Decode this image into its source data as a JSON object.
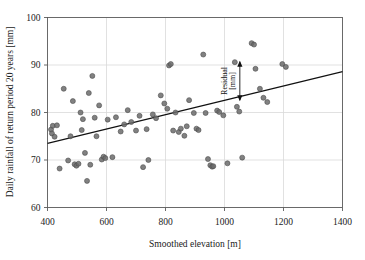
{
  "chart_data": {
    "type": "scatter",
    "title": "",
    "xlabel": "Smoothed elevation [m]",
    "ylabel": "Daily rainfall of return period 20 years [mm]",
    "xlim": [
      400,
      1400
    ],
    "ylim": [
      60,
      100
    ],
    "xticks": [
      400,
      600,
      800,
      1000,
      1200,
      1400
    ],
    "yticks": [
      60,
      70,
      80,
      90,
      100
    ],
    "xtick_labels": [
      "400",
      "600",
      "800",
      "1000",
      "1200",
      "1400"
    ],
    "ytick_labels": [
      "60",
      "70",
      "80",
      "90",
      "100"
    ],
    "grid": true,
    "legend": "none",
    "marker": {
      "shape": "circle",
      "color": "#6b6b6b",
      "edge_color": "#4d4d4d",
      "size_px": 5,
      "opacity": 0.85
    },
    "points": [
      [
        412,
        76.4
      ],
      [
        415,
        75.6
      ],
      [
        418,
        77.2
      ],
      [
        424,
        74.9
      ],
      [
        432,
        77.3
      ],
      [
        441,
        68.2
      ],
      [
        455,
        85.0
      ],
      [
        470,
        69.9
      ],
      [
        478,
        75.0
      ],
      [
        486,
        82.4
      ],
      [
        492,
        69.1
      ],
      [
        498,
        68.8
      ],
      [
        505,
        69.2
      ],
      [
        512,
        80.0
      ],
      [
        516,
        76.3
      ],
      [
        520,
        78.6
      ],
      [
        527,
        71.5
      ],
      [
        534,
        65.6
      ],
      [
        540,
        84.1
      ],
      [
        545,
        69.0
      ],
      [
        552,
        87.7
      ],
      [
        560,
        78.9
      ],
      [
        566,
        75.0
      ],
      [
        575,
        81.5
      ],
      [
        584,
        70.1
      ],
      [
        590,
        70.7
      ],
      [
        596,
        70.4
      ],
      [
        604,
        78.5
      ],
      [
        620,
        70.6
      ],
      [
        632,
        79.0
      ],
      [
        648,
        76.0
      ],
      [
        660,
        77.5
      ],
      [
        672,
        80.5
      ],
      [
        684,
        78.0
      ],
      [
        700,
        76.2
      ],
      [
        712,
        79.3
      ],
      [
        724,
        68.5
      ],
      [
        736,
        76.5
      ],
      [
        742,
        70.0
      ],
      [
        757,
        79.6
      ],
      [
        768,
        78.8
      ],
      [
        784,
        83.6
      ],
      [
        796,
        81.9
      ],
      [
        806,
        80.8
      ],
      [
        812,
        89.9
      ],
      [
        818,
        90.2
      ],
      [
        826,
        76.2
      ],
      [
        834,
        80.0
      ],
      [
        845,
        75.9
      ],
      [
        852,
        76.6
      ],
      [
        864,
        75.1
      ],
      [
        872,
        77.1
      ],
      [
        880,
        82.6
      ],
      [
        896,
        79.9
      ],
      [
        905,
        76.6
      ],
      [
        912,
        76.3
      ],
      [
        928,
        92.2
      ],
      [
        936,
        79.9
      ],
      [
        944,
        70.2
      ],
      [
        952,
        68.9
      ],
      [
        958,
        68.6
      ],
      [
        962,
        68.7
      ],
      [
        975,
        80.4
      ],
      [
        982,
        80.1
      ],
      [
        996,
        79.4
      ],
      [
        1010,
        69.3
      ],
      [
        1035,
        90.6
      ],
      [
        1042,
        81.2
      ],
      [
        1050,
        80.2
      ],
      [
        1060,
        70.5
      ],
      [
        1092,
        94.6
      ],
      [
        1100,
        94.3
      ],
      [
        1105,
        89.2
      ],
      [
        1120,
        85.0
      ],
      [
        1132,
        83.1
      ],
      [
        1145,
        82.2
      ],
      [
        1196,
        90.2
      ],
      [
        1208,
        89.6
      ]
    ],
    "regression_line": {
      "x": [
        400,
        1400
      ],
      "y": [
        73.5,
        88.6
      ],
      "color": "#111111",
      "width_px": 1.1
    },
    "annotations": [
      {
        "text_lines": [
          "Residual",
          "[mm]"
        ],
        "type": "double-arrow-vertical",
        "x": 1052,
        "y_top": 90.7,
        "y_bottom": 82.6,
        "rotation_deg": -90
      }
    ]
  },
  "annotation": {
    "residual_label": "Residual",
    "residual_unit": "[mm]"
  },
  "axes": {
    "x_title": "Smoothed elevation [m]",
    "y_title": "Daily rainfall of return period 20 years [mm]"
  }
}
